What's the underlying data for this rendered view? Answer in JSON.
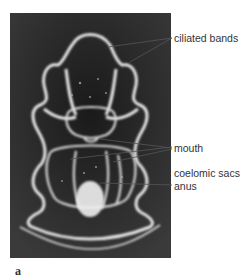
{
  "figure": {
    "panel_letter": "a",
    "photo_description": "larva micrograph",
    "labels": [
      {
        "id": "ciliated-bands",
        "text": "ciliated bands"
      },
      {
        "id": "mouth",
        "text": "mouth"
      },
      {
        "id": "coelomic-sacs",
        "text": "coelomic sacs"
      },
      {
        "id": "anus",
        "text": "anus"
      }
    ]
  }
}
